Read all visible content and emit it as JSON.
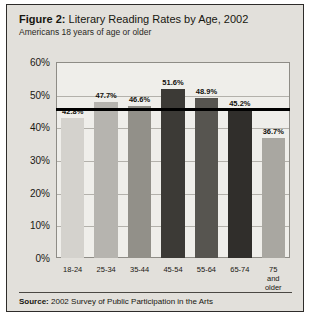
{
  "figure": {
    "title_lead": "Figure 2:",
    "title_rest": " Literary Reading Rates by Age, 2002",
    "subtitle": "Americans 18 years of age or older",
    "source_lead": "Source:",
    "source_rest": " 2002 Survey of Public Participation in the Arts"
  },
  "chart_data": {
    "type": "bar",
    "title": "Figure 2: Literary Reading Rates by Age, 2002",
    "subtitle": "Americans 18 years of age or older",
    "xlabel": "",
    "ylabel": "",
    "ylim": [
      0,
      60
    ],
    "ytick_step": 10,
    "ytick_labels": [
      "0%",
      "10%",
      "20%",
      "30%",
      "40%",
      "50%",
      "60%"
    ],
    "ytick_values": [
      0,
      10,
      20,
      30,
      40,
      50,
      60
    ],
    "grid": true,
    "legend": "none",
    "categories": [
      "18-24",
      "25-34",
      "35-44",
      "45-54",
      "55-64",
      "65-74",
      "75 and\nolder"
    ],
    "values": [
      42.8,
      47.7,
      46.6,
      51.6,
      48.9,
      45.2,
      36.7
    ],
    "value_labels": [
      "42.8%",
      "47.7%",
      "46.6%",
      "51.6%",
      "48.9%",
      "45.2%",
      "36.7%"
    ],
    "bar_colors": [
      "#d4d2cd",
      "#b6b4af",
      "#929089",
      "#3c3a36",
      "#575550",
      "#302e2b",
      "#a9a7a1"
    ],
    "reference_line": {
      "value": 45.7,
      "color": "#000000",
      "label": ""
    },
    "annotations": [
      "Source: 2002 Survey of Public Participation in the Arts"
    ]
  }
}
